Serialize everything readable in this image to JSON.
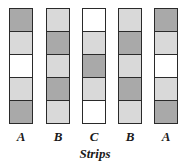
{
  "colors": {
    "dark": "#a9a9a9",
    "light": "#d9d9d9",
    "white": "#ffffff",
    "border": "#2a2a2a"
  },
  "strips": [
    {
      "label": "A",
      "left": 9,
      "cells": [
        "dark",
        "light",
        "white",
        "light",
        "dark"
      ]
    },
    {
      "label": "B",
      "left": 46,
      "cells": [
        "light",
        "dark",
        "light",
        "dark",
        "light"
      ]
    },
    {
      "label": "C",
      "left": 82,
      "cells": [
        "white",
        "light",
        "dark",
        "light",
        "white"
      ]
    },
    {
      "label": "B",
      "left": 118,
      "cells": [
        "light",
        "dark",
        "light",
        "dark",
        "light"
      ]
    },
    {
      "label": "A",
      "left": 154,
      "cells": [
        "dark",
        "light",
        "white",
        "light",
        "dark"
      ]
    }
  ],
  "axis_title": "Strips"
}
